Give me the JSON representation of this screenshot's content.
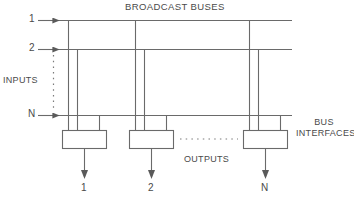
{
  "figure": {
    "title": "BROADCAST BUSES",
    "inputs_label": "INPUTS",
    "outputs_label": "OUTPUTS",
    "bus_interfaces_label_line1": "BUS",
    "bus_interfaces_label_line2": "INTERFACES",
    "input_labels": [
      "1",
      "2",
      "N"
    ],
    "output_labels": [
      "1",
      "2",
      "N"
    ],
    "vertical_ellipsis": ":",
    "horizontal_ellipsis": ". . . . . . . . . . ."
  },
  "colors": {
    "line": "#6a6a6a",
    "text": "#4a4a4a",
    "background": "#ffffff",
    "box_stroke": "#6a6a6a"
  },
  "geometry": {
    "buses": [
      {
        "label": "1",
        "y": 20
      },
      {
        "label": "2",
        "y": 49
      },
      {
        "label": "N",
        "y": 115
      }
    ],
    "bus_x_start": 58,
    "bus_x_end": 292,
    "interfaces": [
      {
        "label": "1",
        "x": 62,
        "width": 44
      },
      {
        "label": "2",
        "x": 129,
        "width": 44
      },
      {
        "label": "N",
        "x": 243,
        "width": 44
      }
    ],
    "box_top": 130,
    "box_height": 18
  }
}
